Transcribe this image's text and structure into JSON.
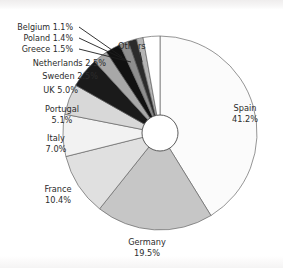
{
  "chart_data": {
    "type": "pie",
    "title": "",
    "subtitle": "",
    "xlabel": "",
    "ylabel": "",
    "donut": true,
    "start_angle_deg": 0,
    "direction": "clockwise",
    "legend_position": "none",
    "labels_inline": true,
    "categories": [
      "Spain",
      "Germany",
      "France",
      "Italy",
      "Portugal",
      "UK",
      "Sweden",
      "Netherlands",
      "Greece",
      "Poland",
      "Belgium",
      "Others"
    ],
    "values": [
      41.2,
      19.5,
      10.4,
      7.0,
      5.1,
      5.0,
      2.5,
      2.5,
      1.5,
      1.4,
      1.1,
      2.8
    ],
    "unit": "%",
    "slices": [
      {
        "name": "Spain",
        "value": 41.2,
        "label": "Spain",
        "percent_label": "41.2%",
        "color": "#fbfbfb"
      },
      {
        "name": "Germany",
        "value": 19.5,
        "label": "Germany",
        "percent_label": "19.5%",
        "color": "#c6c6c6"
      },
      {
        "name": "France",
        "value": 10.4,
        "label": "France",
        "percent_label": "10.4%",
        "color": "#e0e0e0"
      },
      {
        "name": "Italy",
        "value": 7.0,
        "label": "Italy",
        "percent_label": "7.0%",
        "color": "#f2f2f2"
      },
      {
        "name": "Portugal",
        "value": 5.1,
        "label": "Portugal",
        "percent_label": "5.1%",
        "color": "#d8d8d8"
      },
      {
        "name": "UK",
        "value": 5.0,
        "label": "UK",
        "percent_label": "5.0%",
        "color": "#1a1a1a"
      },
      {
        "name": "Sweden",
        "value": 2.5,
        "label": "Sweden",
        "percent_label": "2.5%",
        "color": "#a8a8a8"
      },
      {
        "name": "Netherlands",
        "value": 2.5,
        "label": "Netherlands",
        "percent_label": "2.5%",
        "color": "#111111"
      },
      {
        "name": "Greece",
        "value": 1.5,
        "label": "Greece",
        "percent_label": "1.5%",
        "color": "#8e8e8e"
      },
      {
        "name": "Poland",
        "value": 1.4,
        "label": "Poland",
        "percent_label": "1.4%",
        "color": "#2b2b2b"
      },
      {
        "name": "Belgium",
        "value": 1.1,
        "label": "Belgium",
        "percent_label": "1.1%",
        "color": "#b5b5b5"
      },
      {
        "name": "Others",
        "value": 2.8,
        "label": "Others",
        "percent_label": "",
        "color": "#ffffff"
      }
    ],
    "annotations": [
      {
        "name": "others-callout",
        "text": "Others",
        "has_leader_line": true
      },
      {
        "name": "greece-callout",
        "text": "Greece 1.5%",
        "has_leader_line": true
      },
      {
        "name": "poland-callout",
        "text": "Poland 1.4%",
        "has_leader_line": true
      },
      {
        "name": "belgium-callout",
        "text": "Belgium 1.1%",
        "has_leader_line": true
      }
    ]
  },
  "labels": {
    "belgium": "Belgium 1.1%",
    "poland": "Poland 1.4%",
    "greece": "Greece 1.5%",
    "netherlands": "Netherlands 2.5%",
    "sweden": "Sweden 2.5%",
    "uk": "UK 5.0%",
    "others": "Others",
    "portugal_name": "Portugal",
    "portugal_pct": "5.1%",
    "italy_name": "Italy",
    "italy_pct": "7.0%",
    "france_name": "France",
    "france_pct": "10.4%",
    "germany_name": "Germany",
    "germany_pct": "19.5%",
    "spain_name": "Spain",
    "spain_pct": "41.2%"
  },
  "colors": {
    "background": "#ffffff",
    "text": "#2c2c2c",
    "slice_border": "#5d5d5d",
    "leader_line": "#1d1d1d"
  }
}
